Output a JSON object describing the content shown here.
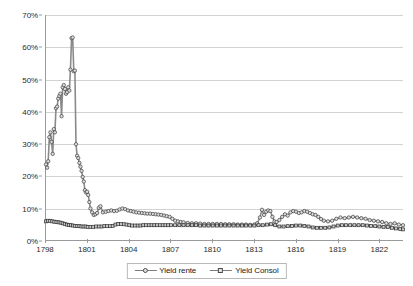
{
  "chart_data": {
    "type": "line",
    "title": "",
    "subtitle": "",
    "xlabel": "",
    "ylabel": "",
    "xlim": [
      1798,
      1823.7
    ],
    "ylim": [
      0,
      0.7
    ],
    "grid": true,
    "legend_position": "bottom",
    "y_tick_labels": [
      "70%",
      "60%",
      "50%",
      "40%",
      "30%",
      "20%",
      "10%",
      "0%"
    ],
    "y_tick_values": [
      0.7,
      0.6,
      0.5,
      0.4,
      0.3,
      0.2,
      0.1,
      0.0
    ],
    "x_tick_labels": [
      "1798",
      "1801",
      "1804",
      "1807",
      "1810",
      "1813",
      "1816",
      "1819",
      "1822"
    ],
    "x_tick_values": [
      1798,
      1801,
      1804,
      1807,
      1810,
      1813,
      1816,
      1819,
      1822
    ],
    "series": [
      {
        "name": "Yield rente",
        "color": "#8a8a8a",
        "marker": "circle",
        "marker_fill": "#dcdcdc",
        "marker_edge": "#3c3c3c",
        "x": [
          1798.0,
          1798.08,
          1798.16,
          1798.24,
          1798.32,
          1798.4,
          1798.48,
          1798.56,
          1798.64,
          1798.72,
          1798.8,
          1798.88,
          1798.96,
          1799.04,
          1799.12,
          1799.2,
          1799.28,
          1799.36,
          1799.44,
          1799.52,
          1799.6,
          1799.68,
          1799.76,
          1799.84,
          1799.92,
          1800.0,
          1800.08,
          1800.16,
          1800.24,
          1800.32,
          1800.4,
          1800.48,
          1800.56,
          1800.64,
          1800.72,
          1800.8,
          1800.88,
          1800.96,
          1801.04,
          1801.12,
          1801.2,
          1801.32,
          1801.44,
          1801.56,
          1801.68,
          1801.8,
          1801.92,
          1802.1,
          1802.3,
          1802.5,
          1802.7,
          1802.9,
          1803.1,
          1803.3,
          1803.5,
          1803.7,
          1803.9,
          1804.1,
          1804.3,
          1804.5,
          1804.7,
          1804.9,
          1805.1,
          1805.3,
          1805.5,
          1805.7,
          1805.9,
          1806.1,
          1806.3,
          1806.5,
          1806.7,
          1806.9,
          1807.1,
          1807.3,
          1807.5,
          1807.7,
          1807.9,
          1808.2,
          1808.5,
          1808.8,
          1809.1,
          1809.4,
          1809.7,
          1810.0,
          1810.3,
          1810.6,
          1810.9,
          1811.2,
          1811.5,
          1811.8,
          1812.1,
          1812.4,
          1812.7,
          1813.0,
          1813.2,
          1813.4,
          1813.55,
          1813.7,
          1813.85,
          1814.0,
          1814.15,
          1814.3,
          1814.45,
          1814.6,
          1814.8,
          1815.0,
          1815.2,
          1815.4,
          1815.6,
          1815.8,
          1816.0,
          1816.2,
          1816.4,
          1816.6,
          1816.8,
          1817.0,
          1817.2,
          1817.4,
          1817.6,
          1817.8,
          1818.0,
          1818.3,
          1818.6,
          1818.9,
          1819.2,
          1819.5,
          1819.8,
          1820.1,
          1820.4,
          1820.7,
          1821.0,
          1821.3,
          1821.6,
          1821.9,
          1822.2,
          1822.5,
          1822.8,
          1823.1,
          1823.4,
          1823.7
        ],
        "y": [
          0.235,
          0.225,
          0.245,
          0.32,
          0.335,
          0.305,
          0.268,
          0.345,
          0.335,
          0.41,
          0.415,
          0.44,
          0.448,
          0.455,
          0.385,
          0.475,
          0.482,
          0.47,
          0.455,
          0.46,
          0.475,
          0.465,
          0.53,
          0.628,
          0.63,
          0.525,
          0.527,
          0.298,
          0.262,
          0.255,
          0.24,
          0.228,
          0.215,
          0.196,
          0.182,
          0.155,
          0.148,
          0.15,
          0.14,
          0.118,
          0.098,
          0.086,
          0.078,
          0.08,
          0.084,
          0.1,
          0.105,
          0.086,
          0.088,
          0.09,
          0.092,
          0.09,
          0.091,
          0.095,
          0.098,
          0.096,
          0.092,
          0.09,
          0.088,
          0.086,
          0.085,
          0.084,
          0.083,
          0.082,
          0.082,
          0.081,
          0.08,
          0.079,
          0.078,
          0.076,
          0.074,
          0.072,
          0.066,
          0.06,
          0.058,
          0.056,
          0.055,
          0.053,
          0.052,
          0.052,
          0.051,
          0.05,
          0.05,
          0.05,
          0.05,
          0.05,
          0.049,
          0.049,
          0.049,
          0.048,
          0.048,
          0.048,
          0.047,
          0.048,
          0.052,
          0.07,
          0.094,
          0.078,
          0.088,
          0.092,
          0.09,
          0.072,
          0.058,
          0.056,
          0.062,
          0.072,
          0.08,
          0.076,
          0.086,
          0.09,
          0.088,
          0.084,
          0.086,
          0.09,
          0.088,
          0.084,
          0.08,
          0.078,
          0.072,
          0.065,
          0.06,
          0.058,
          0.06,
          0.066,
          0.07,
          0.068,
          0.07,
          0.072,
          0.07,
          0.068,
          0.066,
          0.062,
          0.06,
          0.058,
          0.056,
          0.052,
          0.05,
          0.052,
          0.048,
          0.046
        ]
      },
      {
        "name": "Yield Consol",
        "color": "#6e6e6e",
        "marker": "square",
        "marker_fill": "#c8c8c8",
        "marker_edge": "#2f2f2f",
        "x": [
          1798.0,
          1798.15,
          1798.3,
          1798.45,
          1798.6,
          1798.75,
          1798.9,
          1799.05,
          1799.2,
          1799.35,
          1799.5,
          1799.65,
          1799.8,
          1799.95,
          1800.1,
          1800.25,
          1800.4,
          1800.55,
          1800.7,
          1800.85,
          1801.0,
          1801.2,
          1801.4,
          1801.6,
          1801.8,
          1802.0,
          1802.2,
          1802.4,
          1802.6,
          1802.8,
          1803.0,
          1803.2,
          1803.4,
          1803.6,
          1803.8,
          1804.0,
          1804.2,
          1804.4,
          1804.6,
          1804.8,
          1805.0,
          1805.2,
          1805.4,
          1805.6,
          1805.8,
          1806.0,
          1806.2,
          1806.4,
          1806.6,
          1806.8,
          1807.0,
          1807.3,
          1807.6,
          1807.9,
          1808.2,
          1808.5,
          1808.8,
          1809.1,
          1809.4,
          1809.7,
          1810.0,
          1810.3,
          1810.6,
          1810.9,
          1811.2,
          1811.5,
          1811.8,
          1812.1,
          1812.4,
          1812.7,
          1813.0,
          1813.3,
          1813.6,
          1813.9,
          1814.2,
          1814.5,
          1814.8,
          1815.1,
          1815.4,
          1815.7,
          1816.0,
          1816.3,
          1816.6,
          1816.9,
          1817.2,
          1817.5,
          1817.8,
          1818.1,
          1818.4,
          1818.7,
          1819.0,
          1819.3,
          1819.6,
          1819.9,
          1820.2,
          1820.5,
          1820.8,
          1821.1,
          1821.4,
          1821.7,
          1822.0,
          1822.3,
          1822.6,
          1822.9,
          1823.2,
          1823.5,
          1823.7
        ],
        "y": [
          0.058,
          0.06,
          0.059,
          0.058,
          0.057,
          0.056,
          0.055,
          0.054,
          0.052,
          0.05,
          0.048,
          0.047,
          0.046,
          0.045,
          0.044,
          0.043,
          0.043,
          0.042,
          0.042,
          0.042,
          0.041,
          0.041,
          0.041,
          0.042,
          0.042,
          0.042,
          0.043,
          0.043,
          0.043,
          0.044,
          0.048,
          0.05,
          0.05,
          0.049,
          0.048,
          0.046,
          0.045,
          0.045,
          0.045,
          0.045,
          0.046,
          0.046,
          0.046,
          0.046,
          0.046,
          0.046,
          0.046,
          0.046,
          0.046,
          0.046,
          0.046,
          0.046,
          0.046,
          0.046,
          0.046,
          0.046,
          0.046,
          0.045,
          0.045,
          0.045,
          0.045,
          0.045,
          0.045,
          0.045,
          0.045,
          0.045,
          0.045,
          0.045,
          0.045,
          0.045,
          0.045,
          0.046,
          0.046,
          0.048,
          0.049,
          0.046,
          0.042,
          0.042,
          0.043,
          0.044,
          0.045,
          0.045,
          0.044,
          0.042,
          0.039,
          0.038,
          0.038,
          0.038,
          0.039,
          0.042,
          0.045,
          0.046,
          0.046,
          0.046,
          0.046,
          0.046,
          0.046,
          0.045,
          0.044,
          0.043,
          0.042,
          0.041,
          0.04,
          0.038,
          0.036,
          0.034,
          0.033
        ]
      }
    ]
  },
  "legend": {
    "entries": [
      {
        "label": "Yield rente"
      },
      {
        "label": "Yield Consol"
      }
    ]
  }
}
